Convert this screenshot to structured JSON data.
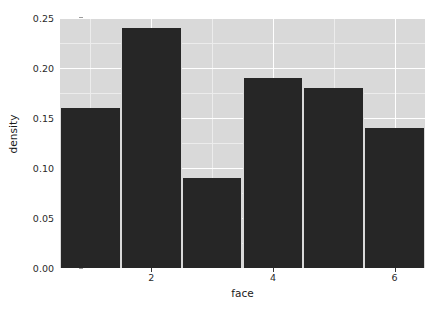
{
  "chart_data": {
    "type": "bar",
    "title": "",
    "subtitle": "",
    "xlabel": "face",
    "ylabel": "density",
    "categories": [
      "1",
      "2",
      "3",
      "4",
      "5",
      "6"
    ],
    "values": [
      0.16,
      0.24,
      0.09,
      0.19,
      0.18,
      0.14
    ],
    "series": [
      {
        "name": "density",
        "values": [
          0.16,
          0.24,
          0.09,
          0.19,
          0.18,
          0.14
        ]
      }
    ],
    "xlim": [
      0.5,
      6.5
    ],
    "ylim": [
      0.0,
      0.25
    ],
    "x_tick_values": [
      2,
      4,
      6
    ],
    "x_tick_labels": [
      "2",
      "4",
      "6"
    ],
    "y_tick_values": [
      0.0,
      0.05,
      0.1,
      0.15,
      0.2,
      0.25
    ],
    "y_tick_labels": [
      "0.00",
      "0.05",
      "0.10",
      "0.15",
      "0.20",
      "0.25"
    ],
    "y_minor_tick_values": [
      0.025,
      0.075,
      0.125,
      0.175,
      0.225
    ],
    "x_minor_tick_values": [
      1,
      3,
      5
    ],
    "grid": true,
    "legend": null,
    "legend_position": "none",
    "annotations": [],
    "colors": {
      "bar_fill": "#262626",
      "panel_background": "#d9d9d9",
      "major_gridline": "#ffffff",
      "minor_gridline": "#ececec",
      "axis_text": "#2b2b2b",
      "axis_title": "#1a1a1a",
      "figure_background": "#ffffff"
    }
  }
}
